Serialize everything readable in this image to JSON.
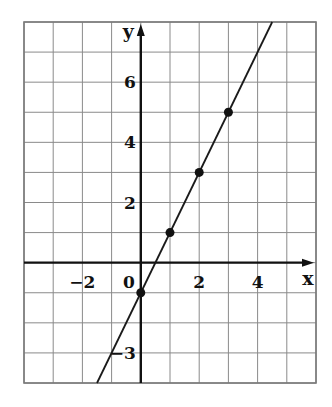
{
  "chart_data": {
    "type": "line",
    "title": "",
    "xlabel": "x",
    "ylabel": "y",
    "xlim": [
      -4,
      6
    ],
    "ylim": [
      -4,
      8
    ],
    "grid": true,
    "grid_step": 1,
    "x_ticks": [
      -2,
      2,
      4
    ],
    "x_tick_labels": [
      "−2",
      "2",
      "4"
    ],
    "y_ticks": [
      -3,
      2,
      4,
      6
    ],
    "y_tick_labels": [
      "−3",
      "2",
      "4",
      "6"
    ],
    "origin_label": "0",
    "series": [
      {
        "name": "y = 2x - 1",
        "equation": "y = 2x - 1",
        "slope": 2,
        "intercept": -1,
        "line_extent_x": [
          -1.5,
          4.5
        ],
        "points": [
          {
            "x": 0,
            "y": -1
          },
          {
            "x": 1,
            "y": 1
          },
          {
            "x": 2,
            "y": 3
          },
          {
            "x": 3,
            "y": 5
          }
        ]
      }
    ]
  }
}
